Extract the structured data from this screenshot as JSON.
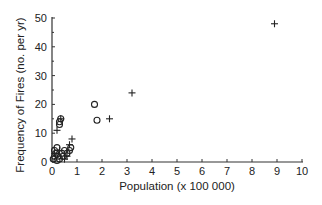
{
  "chart_data": {
    "type": "scatter",
    "title": "",
    "xlabel": "Population (x 100 000)",
    "ylabel": "Frequency of Fires (no. per yr)",
    "xlim": [
      0,
      10
    ],
    "ylim": [
      0,
      50
    ],
    "xticks": [
      "0",
      "1",
      "2",
      "3",
      "4",
      "5",
      "6",
      "7",
      "8",
      "9",
      "10"
    ],
    "yticks": [
      "0",
      "10",
      "20",
      "30",
      "40",
      "50"
    ],
    "grid": false,
    "legend": "none",
    "series": [
      {
        "name": "circles",
        "marker": "circle",
        "points": [
          [
            0.05,
            1
          ],
          [
            0.1,
            2
          ],
          [
            0.1,
            4
          ],
          [
            0.15,
            3
          ],
          [
            0.2,
            0.5
          ],
          [
            0.2,
            5
          ],
          [
            0.25,
            2
          ],
          [
            0.3,
            1
          ],
          [
            0.3,
            13
          ],
          [
            0.3,
            14
          ],
          [
            0.35,
            15
          ],
          [
            0.4,
            3
          ],
          [
            0.45,
            2
          ],
          [
            0.5,
            4
          ],
          [
            0.6,
            3
          ],
          [
            0.7,
            4
          ],
          [
            0.75,
            5
          ],
          [
            1.7,
            20
          ],
          [
            1.8,
            14.5
          ]
        ]
      },
      {
        "name": "crosses",
        "marker": "plus",
        "points": [
          [
            0.1,
            3
          ],
          [
            0.2,
            11
          ],
          [
            0.3,
            4
          ],
          [
            0.35,
            15
          ],
          [
            0.5,
            1
          ],
          [
            0.6,
            2
          ],
          [
            0.7,
            6
          ],
          [
            0.8,
            8
          ],
          [
            2.3,
            15
          ],
          [
            3.2,
            24
          ],
          [
            8.9,
            48
          ]
        ]
      }
    ]
  }
}
